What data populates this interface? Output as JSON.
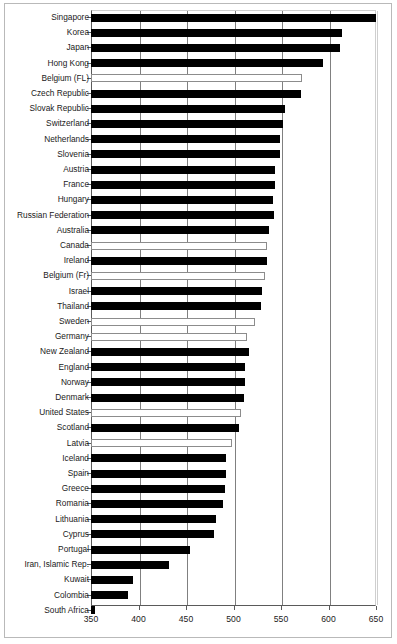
{
  "chart_data": {
    "type": "bar",
    "orientation": "horizontal",
    "title": "",
    "subtitle": "",
    "xlabel": "",
    "ylabel": "",
    "xlim": [
      350,
      650
    ],
    "xticks": [
      350,
      400,
      450,
      500,
      550,
      600,
      650
    ],
    "xtick_labels": [
      "350",
      "400",
      "450",
      "500",
      "550",
      "600",
      "650"
    ],
    "grid": "vertical",
    "legend": null,
    "categories": [
      "Singapore",
      "Korea",
      "Japan",
      "Hong Kong",
      "Belgium (FL)",
      "Czech Republic",
      "Slovak Republic",
      "Switzerland",
      "Netherlands",
      "Slovenia",
      "Austria",
      "France",
      "Hungary",
      "Russian Federation",
      "Australia",
      "Canada",
      "Ireland",
      "Belgium (Fr)",
      "Israel",
      "Thailand",
      "Sweden",
      "Germany",
      "New Zealand",
      "England",
      "Norway",
      "Denmark",
      "United States",
      "Scotland",
      "Latvia",
      "Iceland",
      "Spain",
      "Greece",
      "Romania",
      "Lithuania",
      "Cyprus",
      "Portugal",
      "Iran, Islamic Rep.",
      "Kuwait",
      "Colombia",
      "South Africa"
    ],
    "values": [
      650,
      614,
      612,
      594,
      572,
      571,
      554,
      552,
      549,
      549,
      544,
      544,
      542,
      543,
      537,
      535,
      535,
      533,
      530,
      529,
      523,
      514,
      516,
      512,
      512,
      511,
      508,
      506,
      498,
      492,
      492,
      491,
      489,
      482,
      479,
      454,
      432,
      394,
      389,
      354
    ],
    "bar_styles": [
      "filled",
      "filled",
      "filled",
      "filled",
      "hollow",
      "filled",
      "filled",
      "filled",
      "filled",
      "filled",
      "filled",
      "filled",
      "filled",
      "filled",
      "filled",
      "hollow",
      "filled",
      "hollow",
      "filled",
      "filled",
      "hollow",
      "hollow",
      "filled",
      "filled",
      "filled",
      "filled",
      "hollow",
      "filled",
      "hollow",
      "filled",
      "filled",
      "filled",
      "filled",
      "filled",
      "filled",
      "filled",
      "filled",
      "filled",
      "filled",
      "filled"
    ],
    "colors": {
      "filled": "#000000",
      "hollow_fill": "#ffffff",
      "hollow_border": "#8c8c8c",
      "axis": "#5a5a5a",
      "gridline": "#808080",
      "frame": "#b9b9b9"
    }
  }
}
